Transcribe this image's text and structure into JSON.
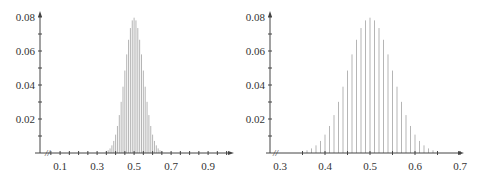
{
  "chart_data": [
    {
      "type": "bar",
      "title": "",
      "xlabel": "",
      "ylabel": "",
      "description": "Stem plot of binomial(100, 0.5) proportions, wide x range",
      "xlim": [
        0,
        1.0
      ],
      "ylim": [
        0,
        0.08
      ],
      "x_ticks": [
        "0.1",
        "0.3",
        "0.5",
        "0.7",
        "0.9"
      ],
      "y_ticks": [
        "0.02",
        "0.04",
        "0.06",
        "0.08"
      ],
      "grid": false,
      "bar_color": "#b5b5b5",
      "x": [
        0.35,
        0.36,
        0.37,
        0.38,
        0.39,
        0.4,
        0.41,
        0.42,
        0.43,
        0.44,
        0.45,
        0.46,
        0.47,
        0.48,
        0.49,
        0.5,
        0.51,
        0.52,
        0.53,
        0.54,
        0.55,
        0.56,
        0.57,
        0.58,
        0.59,
        0.6,
        0.61,
        0.62,
        0.63,
        0.64,
        0.65
      ],
      "values": [
        0.0009,
        0.0016,
        0.0027,
        0.0045,
        0.0071,
        0.0108,
        0.0159,
        0.0223,
        0.0301,
        0.039,
        0.0485,
        0.058,
        0.0666,
        0.0735,
        0.078,
        0.0796,
        0.078,
        0.0735,
        0.0666,
        0.058,
        0.0485,
        0.039,
        0.0301,
        0.0223,
        0.0159,
        0.0108,
        0.0071,
        0.0045,
        0.0027,
        0.0016,
        0.0009
      ]
    },
    {
      "type": "bar",
      "title": "",
      "xlabel": "",
      "ylabel": "",
      "description": "Same distribution zoomed to x range 0.3-0.7",
      "xlim": [
        0.3,
        0.7
      ],
      "ylim": [
        0,
        0.08
      ],
      "x_ticks": [
        "0.3",
        "0.4",
        "0.5",
        "0.6",
        "0.7"
      ],
      "y_ticks": [
        "0.02",
        "0.04",
        "0.06",
        "0.08"
      ],
      "grid": false,
      "bar_color": "#b5b5b5",
      "x": [
        0.35,
        0.36,
        0.37,
        0.38,
        0.39,
        0.4,
        0.41,
        0.42,
        0.43,
        0.44,
        0.45,
        0.46,
        0.47,
        0.48,
        0.49,
        0.5,
        0.51,
        0.52,
        0.53,
        0.54,
        0.55,
        0.56,
        0.57,
        0.58,
        0.59,
        0.6,
        0.61,
        0.62,
        0.63,
        0.64,
        0.65
      ],
      "values": [
        0.0009,
        0.0016,
        0.0027,
        0.0045,
        0.0071,
        0.0108,
        0.0159,
        0.0223,
        0.0301,
        0.039,
        0.0485,
        0.058,
        0.0666,
        0.0735,
        0.078,
        0.0796,
        0.078,
        0.0735,
        0.0666,
        0.058,
        0.0485,
        0.039,
        0.0301,
        0.0223,
        0.0159,
        0.0108,
        0.0071,
        0.0045,
        0.0027,
        0.0016,
        0.0009
      ]
    }
  ],
  "left": {
    "y_labels": [
      "0.08",
      "0.06",
      "0.04",
      "0.02"
    ],
    "x_labels": [
      "0.1",
      "0.3",
      "0.5",
      "0.7",
      "0.9"
    ],
    "axis_break": "//"
  },
  "right": {
    "y_labels": [
      "0.08",
      "0.06",
      "0.04",
      "0.02"
    ],
    "x_labels": [
      "0.3",
      "0.4",
      "0.5",
      "0.6",
      "0.7"
    ],
    "axis_break": "//"
  }
}
